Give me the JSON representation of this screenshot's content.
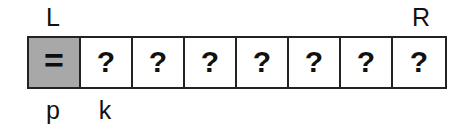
{
  "diagram": {
    "cell_count": 8,
    "cell_width_px": 52,
    "colors": {
      "pivot_fill": "#a8a8a8",
      "cell_fill": "#ffffff",
      "border": "#222222",
      "text": "#111111",
      "background": "#ffffff"
    },
    "top_labels": [
      {
        "index": 0,
        "text": "L"
      },
      {
        "index": 7,
        "text": "R"
      }
    ],
    "bottom_labels": [
      {
        "index": 0,
        "text": "p"
      },
      {
        "index": 1,
        "text": "k"
      }
    ],
    "cells": [
      {
        "index": 0,
        "glyph": "=",
        "state": "pivot",
        "filled": true
      },
      {
        "index": 1,
        "glyph": "?",
        "state": "unknown",
        "filled": false
      },
      {
        "index": 2,
        "glyph": "?",
        "state": "unknown",
        "filled": false
      },
      {
        "index": 3,
        "glyph": "?",
        "state": "unknown",
        "filled": false
      },
      {
        "index": 4,
        "glyph": "?",
        "state": "unknown",
        "filled": false
      },
      {
        "index": 5,
        "glyph": "?",
        "state": "unknown",
        "filled": false
      },
      {
        "index": 6,
        "glyph": "?",
        "state": "unknown",
        "filled": false
      },
      {
        "index": 7,
        "glyph": "?",
        "state": "unknown",
        "filled": false
      }
    ]
  }
}
